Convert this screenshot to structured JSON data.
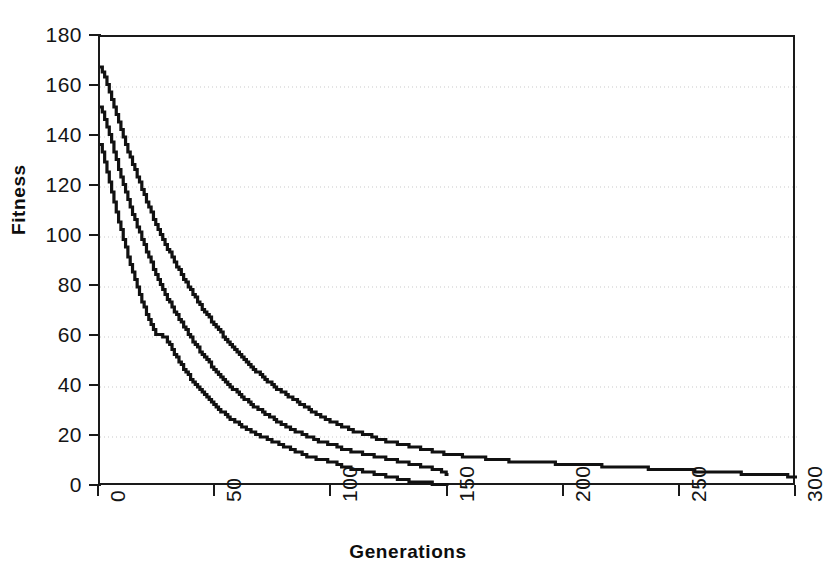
{
  "chart_data": {
    "type": "line",
    "title": "",
    "xlabel": "Generations",
    "ylabel": "Fitness",
    "xlim": [
      0,
      300
    ],
    "ylim": [
      0,
      180
    ],
    "xticks": [
      0,
      50,
      100,
      150,
      200,
      250,
      300
    ],
    "yticks": [
      0,
      20,
      40,
      60,
      80,
      100,
      120,
      140,
      160,
      180
    ],
    "xtick_labels": [
      "0",
      "50",
      "100",
      "150",
      "200",
      "250",
      "300"
    ],
    "ytick_labels": [
      "0",
      "20",
      "40",
      "60",
      "80",
      "100",
      "120",
      "140",
      "160",
      "180"
    ],
    "grid": "horizontal-dotted",
    "legend": "none",
    "line_color": "#111111",
    "line_width": 3.2,
    "series": [
      {
        "name": "run-1-slow-convergence",
        "x": [
          0,
          2,
          4,
          6,
          8,
          10,
          12,
          14,
          16,
          18,
          20,
          24,
          28,
          32,
          36,
          40,
          45,
          50,
          55,
          60,
          65,
          70,
          75,
          80,
          85,
          90,
          95,
          100,
          105,
          110,
          115,
          120,
          125,
          130,
          135,
          140,
          145,
          150,
          160,
          170,
          180,
          190,
          200,
          210,
          220,
          230,
          240,
          250,
          260,
          270,
          280,
          290,
          300
        ],
        "y": [
          168,
          164,
          158,
          152,
          146,
          140,
          134,
          129,
          124,
          119,
          114,
          105,
          97,
          90,
          83,
          77,
          70,
          64,
          58,
          53,
          48,
          44,
          40,
          37,
          34,
          31,
          28,
          26,
          24,
          22,
          21,
          19,
          18,
          17,
          16,
          15,
          14,
          13,
          12,
          11,
          10,
          10,
          9,
          9,
          8,
          8,
          7,
          7,
          6,
          6,
          5,
          5,
          4
        ]
      },
      {
        "name": "run-2-medium-convergence",
        "x": [
          0,
          2,
          4,
          6,
          8,
          10,
          12,
          14,
          16,
          18,
          20,
          24,
          28,
          32,
          36,
          40,
          45,
          50,
          55,
          60,
          65,
          70,
          75,
          80,
          85,
          90,
          95,
          100,
          105,
          110,
          115,
          120,
          125,
          130,
          135,
          140,
          145,
          150
        ],
        "y": [
          152,
          147,
          141,
          134,
          127,
          121,
          115,
          109,
          104,
          99,
          94,
          85,
          77,
          70,
          64,
          58,
          52,
          46,
          41,
          37,
          33,
          30,
          27,
          24,
          22,
          20,
          18,
          17,
          15,
          14,
          13,
          12,
          11,
          10,
          9,
          8,
          7,
          5
        ]
      },
      {
        "name": "run-3-fast-convergence",
        "x": [
          0,
          2,
          4,
          6,
          8,
          10,
          12,
          14,
          16,
          18,
          20,
          24,
          28,
          32,
          36,
          40,
          45,
          50,
          55,
          60,
          65,
          70,
          75,
          80,
          85,
          90,
          95,
          100,
          105,
          110,
          115,
          120,
          125,
          130,
          135,
          140,
          145,
          150
        ],
        "y": [
          137,
          130,
          122,
          114,
          106,
          99,
          92,
          86,
          80,
          74,
          69,
          61,
          60,
          53,
          47,
          42,
          37,
          32,
          28,
          25,
          22,
          20,
          18,
          16,
          14,
          12,
          11,
          10,
          8,
          7,
          6,
          5,
          4,
          3,
          2,
          2,
          1,
          1
        ]
      }
    ]
  },
  "axes": {
    "y_title": "Fitness",
    "x_title": "Generations"
  }
}
